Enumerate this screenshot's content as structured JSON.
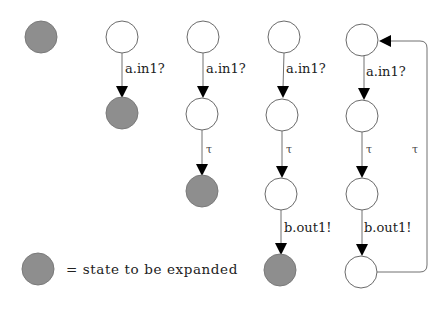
{
  "diagram": {
    "type": "state-space-expansion",
    "colors": {
      "unexpanded_fill": "#8e8e8e",
      "normal_fill": "#ffffff",
      "edge": "#707070",
      "arrowhead": "#000000"
    },
    "columns": [
      {
        "id": "col0",
        "states": [
          {
            "id": "s0",
            "expanded": false
          }
        ],
        "transitions": []
      },
      {
        "id": "col1",
        "states": [
          {
            "id": "s0",
            "expanded": true
          },
          {
            "id": "s1",
            "expanded": false
          }
        ],
        "transitions": [
          {
            "from": "s0",
            "to": "s1",
            "label": "a.in1?"
          }
        ]
      },
      {
        "id": "col2",
        "states": [
          {
            "id": "s0",
            "expanded": true
          },
          {
            "id": "s1",
            "expanded": true
          },
          {
            "id": "s2",
            "expanded": false
          }
        ],
        "transitions": [
          {
            "from": "s0",
            "to": "s1",
            "label": "a.in1?"
          },
          {
            "from": "s1",
            "to": "s2",
            "label": "τ"
          }
        ]
      },
      {
        "id": "col3",
        "states": [
          {
            "id": "s0",
            "expanded": true
          },
          {
            "id": "s1",
            "expanded": true
          },
          {
            "id": "s2",
            "expanded": true
          },
          {
            "id": "s3",
            "expanded": false
          }
        ],
        "transitions": [
          {
            "from": "s0",
            "to": "s1",
            "label": "a.in1?"
          },
          {
            "from": "s1",
            "to": "s2",
            "label": "τ"
          },
          {
            "from": "s2",
            "to": "s3",
            "label": "b.out1!"
          }
        ]
      },
      {
        "id": "col4",
        "states": [
          {
            "id": "s0",
            "expanded": true
          },
          {
            "id": "s1",
            "expanded": true
          },
          {
            "id": "s2",
            "expanded": true
          },
          {
            "id": "s3",
            "expanded": true
          }
        ],
        "transitions": [
          {
            "from": "s0",
            "to": "s1",
            "label": "a.in1?"
          },
          {
            "from": "s1",
            "to": "s2",
            "label": "τ"
          },
          {
            "from": "s2",
            "to": "s3",
            "label": "b.out1!"
          },
          {
            "from": "s3",
            "to": "s0",
            "label": "τ"
          }
        ]
      }
    ],
    "labels": {
      "in": "a.in1?",
      "tau": "τ",
      "out": "b.out1!"
    },
    "legend": {
      "text": "= state to be expanded"
    }
  }
}
